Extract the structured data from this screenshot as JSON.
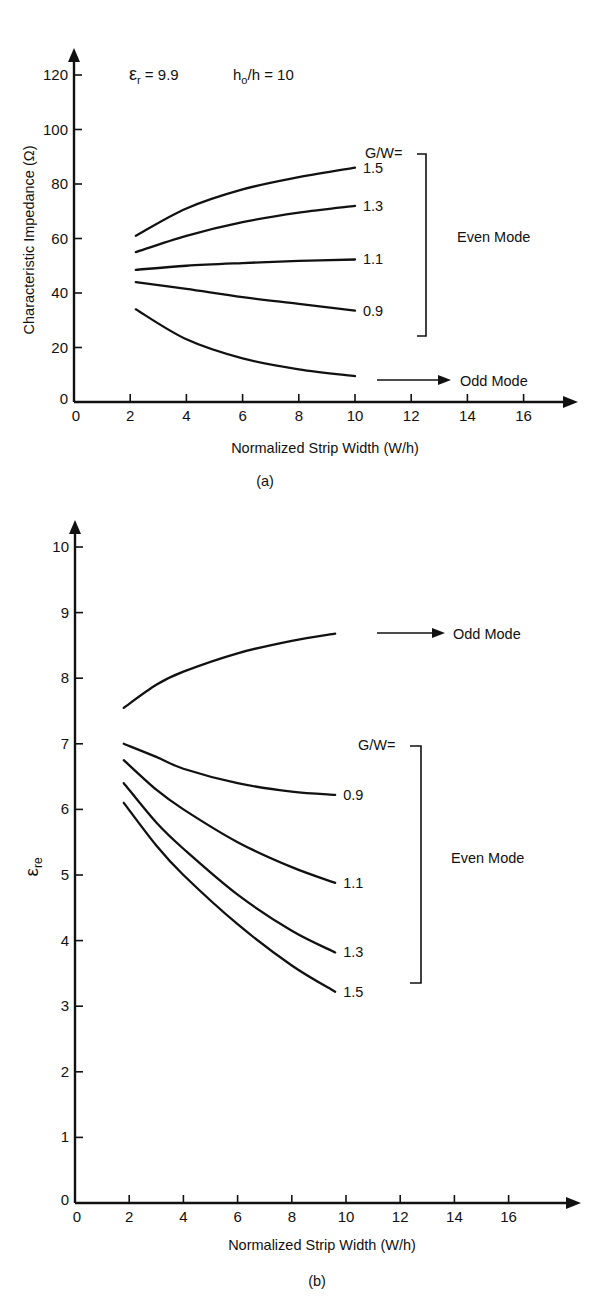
{
  "chart_data": [
    {
      "id": "a",
      "type": "line",
      "caption": "(a)",
      "title": "",
      "annotation_params": {
        "er": "εr = 9.9",
        "er_main": "ε",
        "er_sub": "r",
        "er_value": " = 9.9",
        "ho_main": "h",
        "ho_sub": "o",
        "ho_value": "/h = 10"
      },
      "xlabel": "Normalized Strip Width (W/h)",
      "ylabel": "Characteristic Impedance (Ω)",
      "xlim": [
        0,
        17.5
      ],
      "ylim": [
        0,
        130
      ],
      "xticks": [
        0,
        2,
        4,
        6,
        8,
        10,
        12,
        14,
        16
      ],
      "yticks": [
        0,
        20,
        40,
        60,
        80,
        100,
        120
      ],
      "grid": false,
      "legend_header": "G/W=",
      "group_label": "Even Mode",
      "odd_label": "Odd Mode",
      "series": [
        {
          "name": "Even G/W=1.5",
          "label": "1.5",
          "x": [
            2.2,
            4,
            6,
            8,
            10
          ],
          "y": [
            61,
            71,
            78,
            82.5,
            86
          ]
        },
        {
          "name": "Even G/W=1.3",
          "label": "1.3",
          "x": [
            2.2,
            4,
            6,
            8,
            10
          ],
          "y": [
            55,
            61,
            66,
            69.5,
            72
          ]
        },
        {
          "name": "Even G/W=1.1",
          "label": "1.1",
          "x": [
            2.2,
            4,
            6,
            8,
            10
          ],
          "y": [
            48.5,
            50,
            51,
            51.8,
            52.3
          ]
        },
        {
          "name": "Even G/W=0.9",
          "label": "0.9",
          "x": [
            2.2,
            4,
            6,
            8,
            10
          ],
          "y": [
            44,
            41.5,
            38.5,
            36,
            33.5
          ]
        },
        {
          "name": "Odd Mode",
          "label": "",
          "x": [
            2.2,
            4,
            6,
            8,
            10
          ],
          "y": [
            34,
            23,
            16,
            12,
            9.5
          ]
        }
      ]
    },
    {
      "id": "b",
      "type": "line",
      "caption": "(b)",
      "title": "",
      "xlabel": "Normalized Strip Width (W/h)",
      "ylabel": "εre",
      "ylabel_main": "ε",
      "ylabel_sub": "re",
      "xlim": [
        0,
        17.5
      ],
      "ylim": [
        0,
        10.5
      ],
      "xticks": [
        0,
        2,
        4,
        6,
        8,
        10,
        12,
        14,
        16
      ],
      "yticks": [
        0,
        1,
        2,
        3,
        4,
        5,
        6,
        7,
        8,
        9,
        10
      ],
      "grid": false,
      "legend_header": "G/W=",
      "group_label": "Even Mode",
      "odd_label": "Odd Mode",
      "series": [
        {
          "name": "Odd Mode",
          "label": "",
          "x": [
            1.8,
            3,
            4,
            6,
            8,
            9.6
          ],
          "y": [
            7.55,
            7.9,
            8.1,
            8.38,
            8.57,
            8.68
          ]
        },
        {
          "name": "Even G/W=0.9",
          "label": "0.9",
          "x": [
            1.8,
            3,
            4,
            6,
            8,
            9.6
          ],
          "y": [
            7.0,
            6.8,
            6.62,
            6.4,
            6.27,
            6.22
          ]
        },
        {
          "name": "Even G/W=1.1",
          "label": "1.1",
          "x": [
            1.8,
            3,
            4,
            6,
            8,
            9.6
          ],
          "y": [
            6.75,
            6.3,
            6.0,
            5.5,
            5.12,
            4.88
          ]
        },
        {
          "name": "Even G/W=1.3",
          "label": "1.3",
          "x": [
            1.8,
            3,
            4,
            6,
            8,
            9.6
          ],
          "y": [
            6.4,
            5.8,
            5.4,
            4.7,
            4.15,
            3.82
          ]
        },
        {
          "name": "Even G/W=1.5",
          "label": "1.5",
          "x": [
            1.8,
            3,
            4,
            6,
            8,
            9.6
          ],
          "y": [
            6.1,
            5.45,
            5.0,
            4.25,
            3.62,
            3.22
          ]
        }
      ]
    }
  ]
}
